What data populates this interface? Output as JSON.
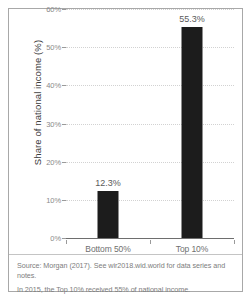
{
  "chart_data": {
    "type": "bar",
    "title": "",
    "categories": [
      "Bottom 50%",
      "Top 10%"
    ],
    "values": [
      12.3,
      55.3
    ],
    "value_labels": [
      "12.3%",
      "55.3%"
    ],
    "xlabel": "",
    "ylabel": "Share of national income (%)",
    "ylim": [
      0,
      60
    ],
    "ytick_labels": [
      "0%",
      "10%",
      "20%",
      "30%",
      "40%",
      "50%",
      "60%"
    ],
    "ytick_values": [
      0,
      10,
      20,
      30,
      40,
      50,
      60
    ],
    "grid": true,
    "legend": "none",
    "bar_color": "#1c1c1c",
    "gridline_color": "#d2d2d2",
    "axis_color": "#6e6e6e"
  },
  "caption": {
    "source": "Source: Morgan (2017). See wir2018.wid.world for data series and notes.",
    "note": "In 2015, the Top 10% received 55% of national income."
  }
}
